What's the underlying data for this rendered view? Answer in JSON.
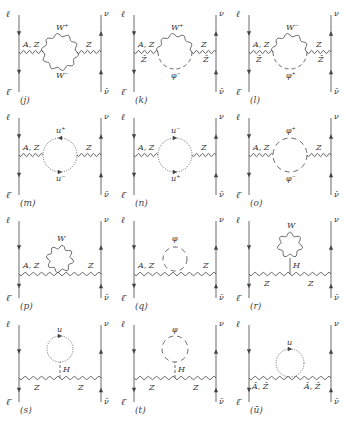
{
  "figure": {
    "line_color": "#444444",
    "background": "#ffffff"
  },
  "diagrams": [
    {
      "id": "j",
      "tag": "(j)",
      "loop_type": "wavy-loop",
      "top": "W⁺",
      "bottom": "W⁻",
      "left_boson": "A, Z",
      "right_boson": "Z",
      "left_sub": "",
      "right_sub": ""
    },
    {
      "id": "k",
      "tag": "(k)",
      "loop_type": "wavy-dashed",
      "top": "W⁺",
      "bottom": "φ⁻",
      "left_boson": "A, Z",
      "right_boson": "Z",
      "left_sub": "Ẑ",
      "right_sub": "Ẑ"
    },
    {
      "id": "l",
      "tag": "(l)",
      "loop_type": "wavy-dashed",
      "top": "W⁻",
      "bottom": "φ⁺",
      "left_boson": "A, Z",
      "right_boson": "Z",
      "left_sub": "Ẑ",
      "right_sub": "Ẑ"
    },
    {
      "id": "m",
      "tag": "(m)",
      "loop_type": "dotted-loop",
      "top": "u⁺",
      "bottom": "u⁻",
      "left_boson": "A, Z",
      "right_boson": "Z",
      "left_sub": "",
      "right_sub": ""
    },
    {
      "id": "n",
      "tag": "(n)",
      "loop_type": "dotted-loop",
      "top": "u⁻",
      "bottom": "u⁺",
      "left_boson": "A, Z",
      "right_boson": "Z",
      "left_sub": "",
      "right_sub": ""
    },
    {
      "id": "o",
      "tag": "(o)",
      "loop_type": "dashed-loop",
      "top": "φ⁺",
      "bottom": "φ⁻",
      "left_boson": "A, Z",
      "right_boson": "Z",
      "left_sub": "",
      "right_sub": ""
    },
    {
      "id": "p",
      "tag": "(p)",
      "loop_type": "seagull-wavy",
      "top": "W",
      "bottom": "",
      "left_boson": "A, Z",
      "right_boson": "Z",
      "left_sub": "",
      "right_sub": ""
    },
    {
      "id": "q",
      "tag": "(q)",
      "loop_type": "seagull-dashed",
      "top": "φ",
      "bottom": "",
      "left_boson": "A, Z",
      "right_boson": "Z",
      "left_sub": "",
      "right_sub": ""
    },
    {
      "id": "r",
      "tag": "(r)",
      "loop_type": "tadpole-wavy",
      "top": "W",
      "bottom": "",
      "left_boson": "Z",
      "right_boson": "Z",
      "left_sub": "",
      "right_sub": "",
      "stem": "H"
    },
    {
      "id": "s",
      "tag": "(s)",
      "loop_type": "tadpole-dotted",
      "top": "u",
      "bottom": "",
      "left_boson": "Z",
      "right_boson": "Z",
      "left_sub": "",
      "right_sub": "",
      "stem": "H"
    },
    {
      "id": "t",
      "tag": "(t)",
      "loop_type": "tadpole-dashed",
      "top": "φ",
      "bottom": "",
      "left_boson": "Z",
      "right_boson": "Z",
      "left_sub": "",
      "right_sub": "",
      "stem": "H"
    },
    {
      "id": "u",
      "tag": "(ū)",
      "loop_type": "seagull-dotted",
      "top": "u",
      "bottom": "",
      "left_boson": "Â, Ẑ",
      "right_boson": "Â, Ẑ",
      "left_sub": "",
      "right_sub": ""
    }
  ],
  "external_labels": {
    "lepton": "ℓ",
    "antilepton": "ℓ̄",
    "neutrino": "ν",
    "antineutrino": "ν̄"
  }
}
